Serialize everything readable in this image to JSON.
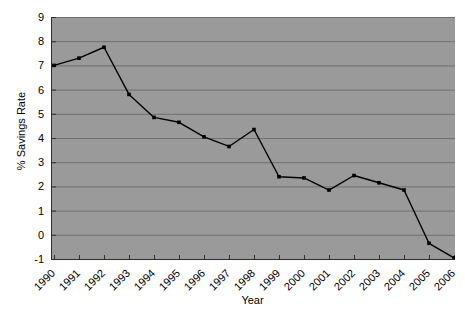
{
  "chart_data": {
    "type": "line",
    "title": "",
    "xlabel": "Year",
    "ylabel": "% Savings Rate",
    "categories": [
      "1990",
      "1991",
      "1992",
      "1993",
      "1994",
      "1995",
      "1996",
      "1997",
      "1998",
      "1999",
      "2000",
      "2001",
      "2002",
      "2003",
      "2004",
      "2005",
      "2006"
    ],
    "values": [
      7.0,
      7.3,
      7.75,
      5.8,
      4.85,
      4.65,
      4.05,
      3.65,
      4.35,
      2.4,
      2.35,
      1.85,
      2.45,
      2.15,
      1.85,
      -0.35,
      -0.95
    ],
    "series": [
      {
        "name": "% Savings Rate",
        "values": [
          7.0,
          7.3,
          7.75,
          5.8,
          4.85,
          4.65,
          4.05,
          3.65,
          4.35,
          2.4,
          2.35,
          1.85,
          2.45,
          2.15,
          1.85,
          -0.35,
          -0.95
        ]
      }
    ],
    "ylim": [
      -1,
      9
    ],
    "y_ticks": [
      9,
      8,
      7,
      6,
      5,
      4,
      3,
      2,
      1,
      0,
      -1
    ],
    "y_tick_labels": [
      "9",
      "8",
      "7",
      "6",
      "5",
      "4",
      "3",
      "2",
      "1",
      "0",
      "-1"
    ],
    "grid": true,
    "grid_axis": "y",
    "legend": false,
    "legend_position": "none",
    "marker": "square",
    "x_tick_rotation": -45,
    "colors": {
      "plot_background": "#9a9a9a",
      "page_background": "#ffffff",
      "gridline": "#6f6f6f",
      "axis": "#2e2e2e",
      "line": "#000000",
      "marker": "#000000",
      "text": "#000000"
    }
  }
}
